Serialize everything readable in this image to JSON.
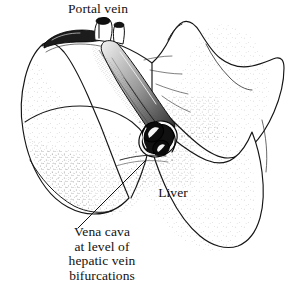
{
  "figure": {
    "subject": "liver",
    "view": "posterior view of liver showing vena cava and portal vein",
    "background_color": "#ffffff",
    "ink_color": "#111111",
    "width": 288,
    "height": 296
  },
  "labels": {
    "portal_vein": "Portal vein",
    "liver": "Liver",
    "vena_cava": {
      "line1": "Vena cava",
      "line2": "at level of",
      "line3": "hepatic vein",
      "line4": "bifurcations"
    }
  },
  "structures": {
    "liver_outline": "liver-organ-outline",
    "left_lobe": "left-hepatic-lobe",
    "right_lobe": "right-hepatic-lobe",
    "caudate_lobe": "caudate-lobe",
    "vena_cava_trunk": "inferior-vena-cava-trunk",
    "vena_cava_cut_end": "vena-cava-cut-cross-section",
    "hepatic_vein_lumen_upper": "hepatic-vein-lumen-upper",
    "hepatic_vein_lumen_lower": "hepatic-vein-lumen-lower",
    "portal_vein_stump_left": "portal-vein-stump-left",
    "portal_vein_stump_right": "portal-vein-stump-right",
    "leader_line_portal_vein": "leader-line-portal-vein",
    "leader_line_vena_cava": "leader-line-vena-cava"
  }
}
